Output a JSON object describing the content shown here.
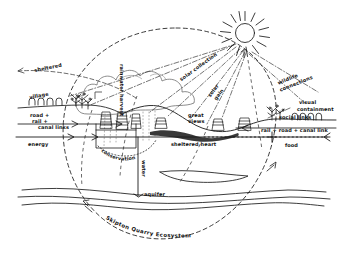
{
  "diagram": {
    "title": "Skipton Quarry Ecosystem",
    "type": "hand-drawn landscape section diagram",
    "medium": "ink sketch on white paper",
    "ink_color": "#121212",
    "boundary_shape": "dashed circle",
    "labels": {
      "sheltered": "sheltered",
      "village": "village",
      "road_rail_canal": "road +\nrail +\ncanal links",
      "energy": "energy",
      "rainwater_harvest": "rainwater harvest",
      "solar_collection": "solar collection",
      "solar_gain": "solar gain",
      "great_views": "great views",
      "wildlife_connections": "wildlife connections",
      "visual_containment": "visual containment",
      "social_links": "social links",
      "rail_road_canal": "rail + road + canal link",
      "food": "food",
      "conservation": "conservation",
      "sheltered_heart": "sheltered heart",
      "water": "water",
      "aquifer": "aquifer"
    },
    "label_lines": {
      "road_rail_canal_l1": "road +",
      "road_rail_canal_l2": "rail +",
      "road_rail_canal_l3": "canal links",
      "visual_containment_l1": "visual",
      "visual_containment_l2": "containment",
      "solar_collection_full": "solar collection",
      "wildlife_l1": "wildlife",
      "wildlife_l2": "connections",
      "great_views_l1": "great",
      "great_views_l2": "views",
      "solar_gain_l1": "solar",
      "solar_gain_l2": "gain"
    },
    "elements": {
      "sun": "sun-with-rays",
      "cloud": "cloud",
      "rain": "rain-dotted-lines",
      "trees": "tree-clusters",
      "buildings": "village-buildings",
      "quarry_faces": "hatched-quarry-faces",
      "water_table": "wavy-aquifer-lines",
      "ground_line": "horizontal-ground-datum"
    }
  }
}
